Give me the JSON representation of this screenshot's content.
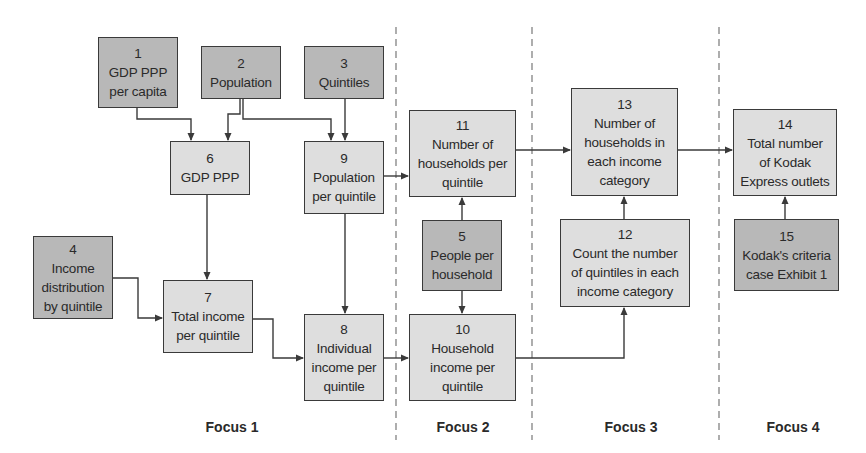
{
  "colors": {
    "input_fill": "#b8b8b8",
    "calc_fill": "#dedede",
    "border": "#3a3a3a",
    "divider": "#9a9a9a"
  },
  "nodes": [
    {
      "id": "1",
      "number": "1",
      "lines": [
        "GDP PPP",
        "per capita"
      ],
      "kind": "input"
    },
    {
      "id": "2",
      "number": "2",
      "lines": [
        "Population"
      ],
      "kind": "input"
    },
    {
      "id": "3",
      "number": "3",
      "lines": [
        "Quintiles"
      ],
      "kind": "input"
    },
    {
      "id": "4",
      "number": "4",
      "lines": [
        "Income",
        "distribution",
        "by quintile"
      ],
      "kind": "input"
    },
    {
      "id": "5",
      "number": "5",
      "lines": [
        "People per",
        "household"
      ],
      "kind": "input"
    },
    {
      "id": "6",
      "number": "6",
      "lines": [
        "GDP PPP"
      ],
      "kind": "calc"
    },
    {
      "id": "7",
      "number": "7",
      "lines": [
        "Total income",
        "per quintile"
      ],
      "kind": "calc"
    },
    {
      "id": "8",
      "number": "8",
      "lines": [
        "Individual",
        "income per",
        "quintile"
      ],
      "kind": "calc"
    },
    {
      "id": "9",
      "number": "9",
      "lines": [
        "Population",
        "per quintile"
      ],
      "kind": "calc"
    },
    {
      "id": "10",
      "number": "10",
      "lines": [
        "Household",
        "income per",
        "quintile"
      ],
      "kind": "calc"
    },
    {
      "id": "11",
      "number": "11",
      "lines": [
        "Number of",
        "households per",
        "quintile"
      ],
      "kind": "calc"
    },
    {
      "id": "12",
      "number": "12",
      "lines": [
        "Count the number",
        "of quintiles in each",
        "income category"
      ],
      "kind": "calc"
    },
    {
      "id": "13",
      "number": "13",
      "lines": [
        "Number of",
        "households in",
        "each income",
        "category"
      ],
      "kind": "calc"
    },
    {
      "id": "14",
      "number": "14",
      "lines": [
        "Total number",
        "of Kodak",
        "Express outlets"
      ],
      "kind": "calc"
    },
    {
      "id": "15",
      "number": "15",
      "lines": [
        "Kodak's criteria",
        "case Exhibit 1"
      ],
      "kind": "input"
    }
  ],
  "edges": [
    {
      "from": "1",
      "to": "6"
    },
    {
      "from": "2",
      "to": "6"
    },
    {
      "from": "2",
      "to": "9"
    },
    {
      "from": "3",
      "to": "9"
    },
    {
      "from": "6",
      "to": "7"
    },
    {
      "from": "4",
      "to": "7"
    },
    {
      "from": "7",
      "to": "8"
    },
    {
      "from": "9",
      "to": "8"
    },
    {
      "from": "9",
      "to": "11"
    },
    {
      "from": "5",
      "to": "11"
    },
    {
      "from": "5",
      "to": "10"
    },
    {
      "from": "8",
      "to": "10"
    },
    {
      "from": "10",
      "to": "12"
    },
    {
      "from": "11",
      "to": "13"
    },
    {
      "from": "12",
      "to": "13"
    },
    {
      "from": "13",
      "to": "14"
    },
    {
      "from": "15",
      "to": "14"
    }
  ],
  "focus_labels": [
    "Focus 1",
    "Focus 2",
    "Focus 3",
    "Focus 4"
  ]
}
